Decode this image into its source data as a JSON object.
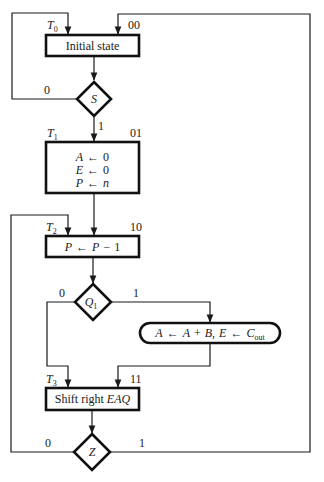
{
  "diagram": {
    "type": "ASM flowchart",
    "states": [
      {
        "id": "T0",
        "label_main": "T",
        "label_sub": "0",
        "code": "00",
        "text": "Initial state"
      },
      {
        "id": "T1",
        "label_main": "T",
        "label_sub": "1",
        "code": "01",
        "lines": [
          "A",
          "E",
          "P"
        ],
        "arrow": "←",
        "values": [
          "0",
          "0",
          "n"
        ]
      },
      {
        "id": "T2",
        "label_main": "T",
        "label_sub": "2",
        "code": "10",
        "text_parts": [
          "P",
          "←",
          "P",
          "−",
          "1"
        ]
      },
      {
        "id": "T3",
        "label_main": "T",
        "label_sub": "3",
        "code": "11",
        "text_plain": "Shift right ",
        "text_italic": "EAQ"
      }
    ],
    "decisions": [
      {
        "id": "S",
        "label": "S",
        "branch0": "0",
        "branch1": "1"
      },
      {
        "id": "Q1",
        "label_main": "Q",
        "label_sub": "1",
        "branch0": "0",
        "branch1": "1"
      },
      {
        "id": "Z",
        "label": "Z",
        "branch0": "0",
        "branch1": "1"
      }
    ],
    "conditional_box": {
      "parts": [
        "A",
        "←",
        "A",
        "+",
        "B,",
        "E",
        "←",
        "C"
      ],
      "sub": "out"
    }
  }
}
